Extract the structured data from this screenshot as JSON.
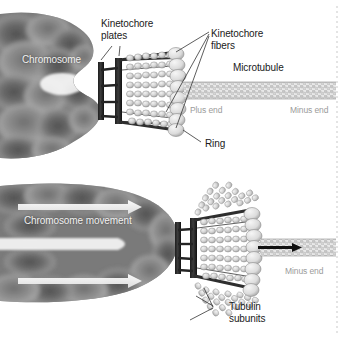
{
  "figure": {
    "panels": [
      {
        "id": "top",
        "name": "attached-kinetochore-panel"
      },
      {
        "id": "bottom",
        "name": "chromosome-movement-panel"
      }
    ],
    "background_color": "#ffffff",
    "divider_color": "#cccccc"
  },
  "labels": {
    "chromosome": "Chromosome",
    "kinetochore_plates": "Kinetochore\nplates",
    "kinetochore_plates_line1": "Kinetochore",
    "kinetochore_plates_line2": "plates",
    "kinetochore_fibers_line1": "Kinetochore",
    "kinetochore_fibers_line2": "fibers",
    "microtubule": "Microtubule",
    "plus_end": "Plus end",
    "minus_end_top": "Minus end",
    "ring": "Ring",
    "chromosome_movement": "Chromosome movement",
    "minus_end_bottom": "Minus end",
    "tubulin_subunits_line1": "Tubulin",
    "tubulin_subunits_line2": "subunits"
  },
  "colors": {
    "chromosome_dark": "#5a5a5a",
    "chromosome_mid": "#7d7d7d",
    "chromosome_light": "#a8a8a8",
    "label_text": "#1a1a1a",
    "white_text": "#f2f2f2",
    "gray_text": "#9b9b9b",
    "plate_dark": "#2b2b2b",
    "tubulin_bead": "#d8d8d8",
    "tubulin_bead_outline": "#8e8e8e",
    "ring_fill": "#e2e2e2",
    "fiber_line": "#3a3a3a",
    "arrow_white": "#f4f4f4",
    "arrow_black": "#111111",
    "leader_line": "#333333"
  },
  "structures": {
    "top_panel": {
      "chromosome_label_pos": "left",
      "kinetochore_plates_count": 2,
      "ring_description": "stack of pale ellipses at microtubule plus end",
      "microtubule_state": "intact, straight lattice",
      "fiber_count": 4
    },
    "bottom_panel": {
      "chromosome_state": "V-shaped moving chromosome",
      "movement_arrows": 2,
      "microtubule_state": "depolymerizing, protofilaments splayed and curling outward",
      "depolymerization_arrow": "black arrow pointing toward minus end"
    }
  }
}
